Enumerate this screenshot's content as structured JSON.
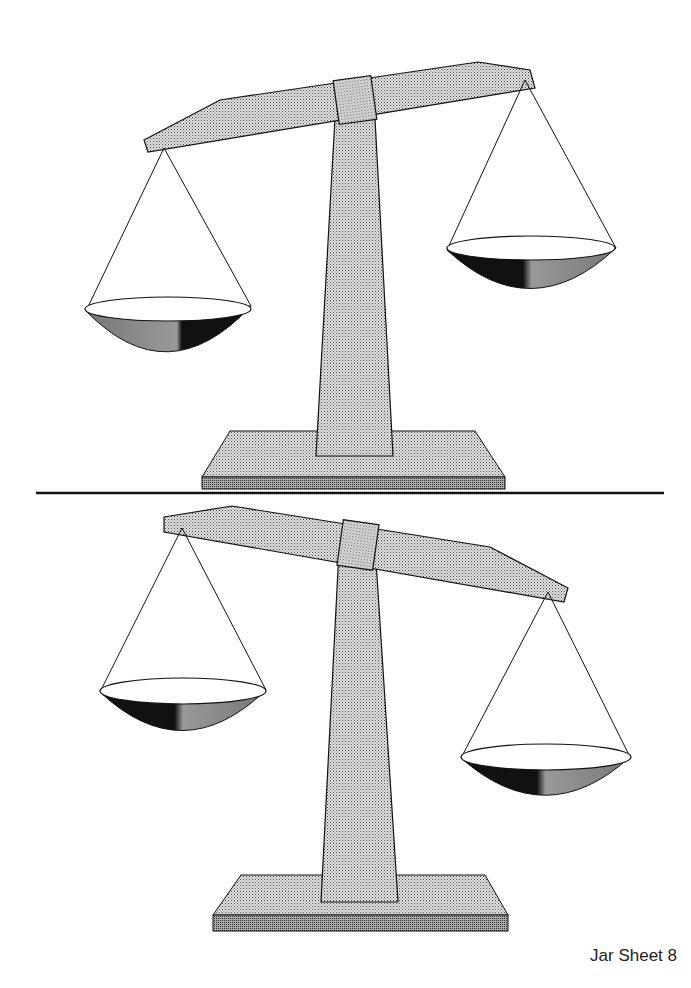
{
  "page": {
    "caption": "Jar Sheet 8"
  },
  "scales": [
    {
      "id": "top",
      "tilt": "left-heavy",
      "description": "Balance scale with left pan lower than right pan"
    },
    {
      "id": "bottom",
      "tilt": "right-heavy",
      "description": "Balance scale with right pan lower than left pan"
    }
  ],
  "colors": {
    "fill_light": "#c8c8c8",
    "fill_mid": "#9a9a9a",
    "fill_dark": "#111111",
    "outline": "#111111",
    "background": "#ffffff"
  }
}
